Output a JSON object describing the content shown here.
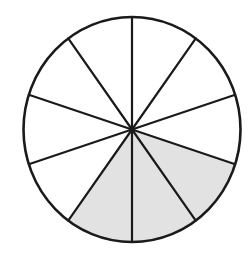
{
  "diagram": {
    "type": "fraction-circle",
    "total_sectors": 10,
    "shaded_sectors": 3,
    "shaded_indices": [
      3,
      4,
      5
    ],
    "start_angle_deg": 0,
    "fraction_shaded": "3/10",
    "colors": {
      "background": "#ffffff",
      "stroke": "#1a1a1a",
      "shaded_fill": "#e2e2e2",
      "unshaded_fill": "#ffffff"
    },
    "geometry": {
      "cx": 132,
      "cy": 129.5,
      "rx": 108.5,
      "ry": 112.5,
      "stroke_width": 2.2
    }
  }
}
